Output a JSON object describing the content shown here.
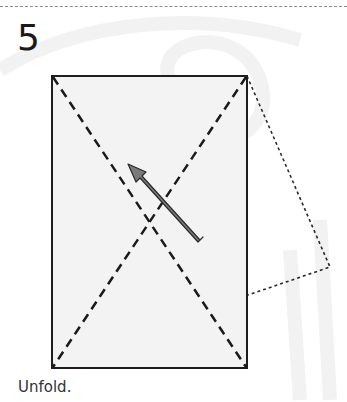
{
  "step": {
    "number": "5",
    "caption": "Unfold."
  },
  "diagram": {
    "paper_fill": "#f3f3f3",
    "outline_color": "#1e1e1e",
    "arrow_fill": "#7a7a7a"
  }
}
